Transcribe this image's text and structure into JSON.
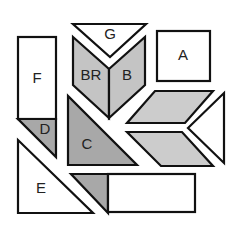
{
  "diagram": {
    "title": "",
    "colors": {
      "white_fill": "#ffffff",
      "light_gray_fill": "#c9c9c9",
      "mid_gray_fill": "#b8b8b8",
      "dark_gray_fill": "#a6a6a6",
      "stroke": "#111111"
    },
    "pieces": [
      {
        "id": "G",
        "label": "G",
        "shape": "triangle",
        "fill": "white"
      },
      {
        "id": "BR",
        "label": "BR",
        "shape": "parallelogram",
        "fill": "gray"
      },
      {
        "id": "B",
        "label": "B",
        "shape": "parallelogram",
        "fill": "gray"
      },
      {
        "id": "A",
        "label": "A",
        "shape": "square",
        "fill": "white"
      },
      {
        "id": "F",
        "label": "F",
        "shape": "rectangle",
        "fill": "white"
      },
      {
        "id": "D",
        "label": "D",
        "shape": "triangle",
        "fill": "gray"
      },
      {
        "id": "C",
        "label": "C",
        "shape": "triangle",
        "fill": "gray"
      },
      {
        "id": "E",
        "label": "E",
        "shape": "triangle",
        "fill": "white"
      },
      {
        "id": "para-upper",
        "label": "",
        "shape": "parallelogram",
        "fill": "gray"
      },
      {
        "id": "para-lower",
        "label": "",
        "shape": "parallelogram",
        "fill": "gray"
      },
      {
        "id": "tri-right",
        "label": "",
        "shape": "triangle",
        "fill": "white"
      },
      {
        "id": "tri-bottom",
        "label": "",
        "shape": "triangle",
        "fill": "gray"
      },
      {
        "id": "rect-bottom",
        "label": "",
        "shape": "rectangle",
        "fill": "white"
      }
    ],
    "labels": {
      "G": "G",
      "BR": "BR",
      "B": "B",
      "A": "A",
      "F": "F",
      "D": "D",
      "C": "C",
      "E": "E"
    }
  }
}
